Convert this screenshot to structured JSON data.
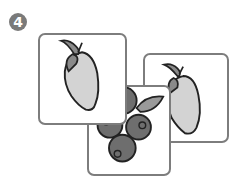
{
  "step": {
    "number": "4",
    "color": "#7a7a7a"
  },
  "cards": [
    {
      "fruit": "mango",
      "position": "front-left"
    },
    {
      "fruit": "blueberries",
      "position": "bottom-center"
    },
    {
      "fruit": "mango",
      "position": "back-right"
    }
  ],
  "colors": {
    "card_border": "#7d7d7d",
    "mango_fill": "#d3d3d3",
    "leaf_fill": "#8a8a8a",
    "berry_fill": "#6e6e6e",
    "outline": "#222222"
  }
}
